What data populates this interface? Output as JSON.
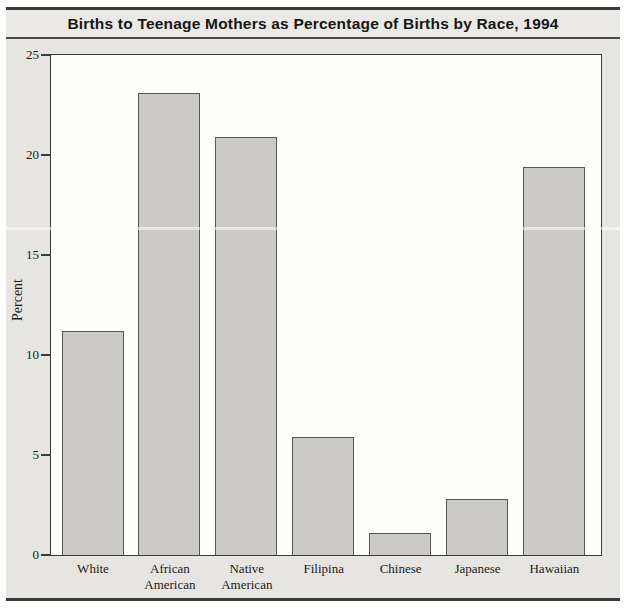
{
  "figure": {
    "title": "Births to Teenage Mothers as Percentage of Births by Race, 1994"
  },
  "chart_data": {
    "type": "bar",
    "title": "Births to Teenage Mothers as Percentage of Births by Race, 1994",
    "categories": [
      "White",
      "African American",
      "Native American",
      "Filipina",
      "Chinese",
      "Japanese",
      "Hawaiian"
    ],
    "category_lines": [
      [
        "White"
      ],
      [
        "African",
        "American"
      ],
      [
        "Native",
        "American"
      ],
      [
        "Filipina"
      ],
      [
        "Chinese"
      ],
      [
        "Japanese"
      ],
      [
        "Hawaiian"
      ]
    ],
    "values": [
      11.2,
      23.1,
      20.9,
      5.9,
      1.1,
      2.8,
      19.4
    ],
    "xlabel": "",
    "ylabel": "Percent",
    "ylim": [
      0,
      25
    ],
    "yticks": [
      0,
      5,
      10,
      15,
      20,
      25
    ],
    "grid": false,
    "legend": "none",
    "colors": {
      "bar_fill": "#cbcac6",
      "bar_border": "#555552",
      "plot_background": "#fdfdfb",
      "figure_background": "#e6e5e1",
      "title_band_background": "#eae9e5",
      "rule": "#3a3a38",
      "text": "#1b1b1b"
    }
  }
}
